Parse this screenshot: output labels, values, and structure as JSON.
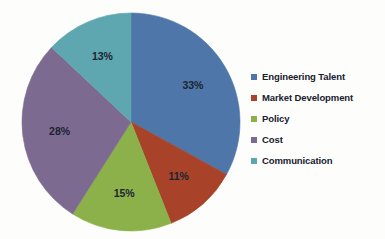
{
  "chart_data": {
    "type": "pie",
    "title": "",
    "subtitle": "",
    "xlabel": "",
    "ylabel": "",
    "grid": false,
    "legend_position": "right",
    "start_angle_deg": 0,
    "direction": "clockwise",
    "categories": [
      "Engineering Talent",
      "Market Development",
      "Policy",
      "Cost",
      "Communication"
    ],
    "values": [
      33,
      11,
      15,
      28,
      13
    ],
    "value_unit": "%",
    "data_labels": [
      "33%",
      "11%",
      "15%",
      "28%",
      "13%"
    ],
    "colors": [
      "#4f76a8",
      "#a8432a",
      "#8cb14a",
      "#7d6a90",
      "#5fa7b0"
    ],
    "slices": [
      {
        "label": "Engineering Talent",
        "value": 33,
        "data_label": "33%",
        "color": "#4f76a8"
      },
      {
        "label": "Market Development",
        "value": 11,
        "data_label": "11%",
        "color": "#a8432a"
      },
      {
        "label": "Policy",
        "value": 15,
        "data_label": "15%",
        "color": "#8cb14a"
      },
      {
        "label": "Cost",
        "value": 28,
        "data_label": "28%",
        "color": "#7d6a90"
      },
      {
        "label": "Communication",
        "value": 13,
        "data_label": "13%",
        "color": "#5fa7b0"
      }
    ]
  },
  "legend": {
    "items": [
      {
        "label": "Engineering Talent",
        "color": "#4f76a8",
        "swatch_name": "legend-swatch-engineering-talent"
      },
      {
        "label": "Market Development",
        "color": "#a8432a",
        "swatch_name": "legend-swatch-market-development"
      },
      {
        "label": "Policy",
        "color": "#8cb14a",
        "swatch_name": "legend-swatch-policy"
      },
      {
        "label": "Cost",
        "color": "#7d6a90",
        "swatch_name": "legend-swatch-cost"
      },
      {
        "label": "Communication",
        "color": "#5fa7b0",
        "swatch_name": "legend-swatch-communication"
      }
    ]
  },
  "geometry": {
    "center_x": 131,
    "center_y": 122,
    "radius": 109,
    "label_radius_ratio": 0.66
  }
}
